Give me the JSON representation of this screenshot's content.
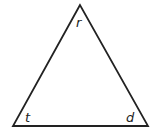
{
  "diagram": {
    "shape": "triangle",
    "stroke_color": "#222222",
    "background": "#ffffff",
    "vertices": [
      {
        "id": "top",
        "label": "r",
        "x": 80,
        "y": 5
      },
      {
        "id": "bottom-left",
        "label": "t",
        "x": 13,
        "y": 126
      },
      {
        "id": "bottom-right",
        "label": "d",
        "x": 148,
        "y": 126
      }
    ]
  }
}
